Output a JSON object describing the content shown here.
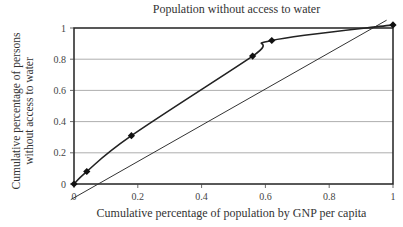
{
  "chart_data": {
    "type": "line",
    "title": "Population without access to water",
    "xlabel": "Cumulative percentage of population by GNP per capita",
    "ylabel": "Cumulative percentage of persons without access to water",
    "xlim": [
      0,
      1
    ],
    "ylim": [
      0,
      1
    ],
    "x_ticks": [
      "0",
      "0.2",
      "0.4",
      "0.6",
      "0.8",
      "1"
    ],
    "y_ticks": [
      "0",
      "0.2",
      "0.4",
      "0.6",
      "0.8",
      "1"
    ],
    "grid": "horizontal",
    "legend": null,
    "series": [
      {
        "name": "Concentration curve",
        "marker": "diamond",
        "x": [
          0,
          0.04,
          0.18,
          0.56,
          0.62,
          1.0
        ],
        "y": [
          0,
          0.08,
          0.31,
          0.82,
          0.92,
          1.02
        ]
      },
      {
        "name": "Line of equality",
        "marker": "none",
        "x": [
          -0.01,
          0.98
        ],
        "y": [
          -0.1,
          1.05
        ]
      }
    ]
  },
  "labels": {
    "title": "Population without access to water",
    "xlabel": "Cumulative percentage of population by GNP per capita",
    "ylabel_line1": "Cumulative percentage of persons",
    "ylabel_line2": "without access to water"
  }
}
